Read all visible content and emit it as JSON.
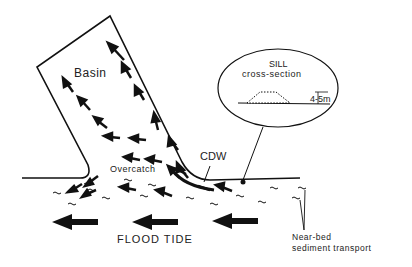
{
  "diagram": {
    "labels": {
      "basin": "Basin",
      "sill_title": "SILL",
      "sill_subtitle": "cross-section",
      "sill_height": "4-5m",
      "cdw": "CDW",
      "overcatch": "Overcatch",
      "flood_tide": "FLOOD TIDE",
      "near_bed_1": "Near-bed",
      "near_bed_2": "sediment transport"
    },
    "colors": {
      "ink": "#111111",
      "background": "#ffffff"
    }
  }
}
